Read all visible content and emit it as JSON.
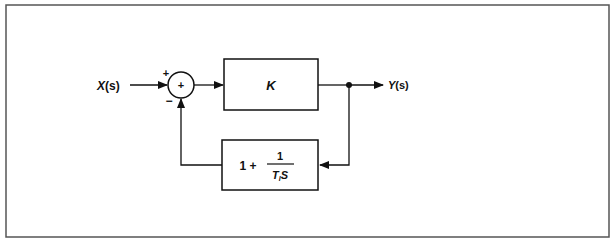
{
  "diagram": {
    "type": "feedback-control-block-diagram",
    "input_label": "X(s)",
    "output_label": "Y(s)",
    "summing_junction": {
      "center_symbol": "+",
      "input_signs": {
        "top_left": "+",
        "bottom": "−"
      }
    },
    "forward_block": {
      "label": "K"
    },
    "feedback_block": {
      "prefix": "1 +",
      "numerator": "1",
      "denominator_T": "T",
      "denominator_sub": "I",
      "denominator_S": "S"
    },
    "colors": {
      "line": "#111111",
      "frame": "#555555",
      "background": "#ffffff"
    }
  }
}
